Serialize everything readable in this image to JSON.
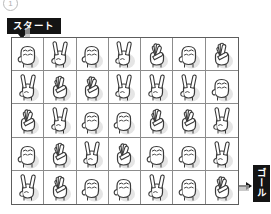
{
  "figure": {
    "marker_number": "1",
    "marker_icon": "circled-number"
  },
  "labels": {
    "start": "スタート",
    "goal": "ゴール",
    "start_arrow_icon": "arrow-down-icon",
    "goal_arrow_icon": "arrow-right-icon"
  },
  "grid": {
    "columns": 7,
    "rows": 5,
    "border_color": "#5d5d5d",
    "line_color": "#8c8c8c",
    "path_color": "#b6b6b6"
  },
  "cells": [
    [
      {
        "gesture": "rock",
        "fingers": 0,
        "name": "hand-rock-icon"
      },
      {
        "gesture": "scissors",
        "fingers": 2,
        "name": "hand-scissors-icon"
      },
      {
        "gesture": "rock",
        "fingers": 0,
        "name": "hand-rock-icon"
      },
      {
        "gesture": "scissors",
        "fingers": 2,
        "name": "hand-scissors-icon"
      },
      {
        "gesture": "paper",
        "fingers": 4,
        "name": "hand-paper-icon"
      },
      {
        "gesture": "rock",
        "fingers": 0,
        "name": "hand-rock-icon"
      },
      {
        "gesture": "paper",
        "fingers": 5,
        "name": "hand-paper-icon"
      }
    ],
    [
      {
        "gesture": "scissors",
        "fingers": 2,
        "name": "hand-scissors-icon"
      },
      {
        "gesture": "paper",
        "fingers": 5,
        "name": "hand-paper-icon"
      },
      {
        "gesture": "paper",
        "fingers": 4,
        "name": "hand-paper-icon"
      },
      {
        "gesture": "scissors",
        "fingers": 2,
        "name": "hand-scissors-icon"
      },
      {
        "gesture": "scissors",
        "fingers": 2,
        "name": "hand-scissors-icon"
      },
      {
        "gesture": "scissors",
        "fingers": 2,
        "name": "hand-scissors-icon"
      },
      {
        "gesture": "rock",
        "fingers": 0,
        "name": "hand-rock-icon"
      }
    ],
    [
      {
        "gesture": "paper",
        "fingers": 4,
        "name": "hand-paper-icon"
      },
      {
        "gesture": "scissors",
        "fingers": 2,
        "name": "hand-scissors-icon"
      },
      {
        "gesture": "rock",
        "fingers": 0,
        "name": "hand-rock-icon"
      },
      {
        "gesture": "rock",
        "fingers": 0,
        "name": "hand-rock-icon"
      },
      {
        "gesture": "paper",
        "fingers": 5,
        "name": "hand-paper-icon"
      },
      {
        "gesture": "paper",
        "fingers": 4,
        "name": "hand-paper-icon"
      },
      {
        "gesture": "scissors",
        "fingers": 2,
        "name": "hand-scissors-icon"
      }
    ],
    [
      {
        "gesture": "rock",
        "fingers": 0,
        "name": "hand-rock-icon"
      },
      {
        "gesture": "paper",
        "fingers": 5,
        "name": "hand-paper-icon"
      },
      {
        "gesture": "scissors",
        "fingers": 2,
        "name": "hand-scissors-icon"
      },
      {
        "gesture": "paper",
        "fingers": 4,
        "name": "hand-paper-icon"
      },
      {
        "gesture": "rock",
        "fingers": 0,
        "name": "hand-rock-icon"
      },
      {
        "gesture": "rock",
        "fingers": 0,
        "name": "hand-rock-icon"
      },
      {
        "gesture": "scissors",
        "fingers": 2,
        "name": "hand-scissors-icon"
      }
    ],
    [
      {
        "gesture": "scissors",
        "fingers": 2,
        "name": "hand-scissors-icon"
      },
      {
        "gesture": "paper",
        "fingers": 5,
        "name": "hand-paper-icon"
      },
      {
        "gesture": "rock",
        "fingers": 0,
        "name": "hand-rock-icon"
      },
      {
        "gesture": "rock",
        "fingers": 0,
        "name": "hand-rock-icon"
      },
      {
        "gesture": "scissors",
        "fingers": 2,
        "name": "hand-scissors-icon"
      },
      {
        "gesture": "rock",
        "fingers": 0,
        "name": "hand-rock-icon"
      },
      {
        "gesture": "paper",
        "fingers": 4,
        "name": "hand-paper-icon"
      }
    ]
  ],
  "path_segments": [
    {
      "id": "entry-stub",
      "orient": "v",
      "col": 1,
      "from_row": 0,
      "to_row": 1
    },
    {
      "id": "col1-down",
      "orient": "v",
      "col": 1,
      "from_row": 1,
      "to_row": 5
    },
    {
      "id": "row5-right-a",
      "orient": "h",
      "row": 5,
      "from_col": 1,
      "to_col": 3
    },
    {
      "id": "col3-up",
      "orient": "v",
      "col": 3,
      "from_row": 1,
      "to_row": 5
    },
    {
      "id": "row2-right",
      "orient": "h",
      "row": 2,
      "from_col": 3,
      "to_col": 4
    },
    {
      "id": "row1-right",
      "orient": "h",
      "row": 1,
      "from_col": 3,
      "to_col": 6
    },
    {
      "id": "col6-down",
      "orient": "v",
      "col": 6,
      "from_row": 1,
      "to_row": 4
    },
    {
      "id": "row4-right",
      "orient": "h",
      "row": 4,
      "from_col": 6,
      "to_col": 7
    },
    {
      "id": "col7-down",
      "orient": "v",
      "col": 7,
      "from_row": 4,
      "to_row": 5
    },
    {
      "id": "exit-stub",
      "orient": "h",
      "row": 5,
      "from_col": 7,
      "to_col": 8
    }
  ]
}
